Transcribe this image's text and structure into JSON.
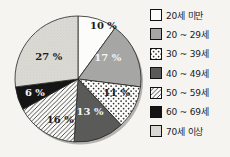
{
  "chart_data": {
    "type": "pie",
    "title": "",
    "unit": "%",
    "start_angle_deg": 0,
    "direction": "clockwise",
    "legend_position": "right",
    "slices": [
      {
        "label": "20세 미만",
        "value": 10,
        "display": "10 %",
        "fill": "white",
        "text_color": "#1c1c1c",
        "la": 26,
        "lr": 0.92
      },
      {
        "label": "20 ~ 29세",
        "value": 17,
        "display": "17 %",
        "fill": "gray",
        "text_color": "#f4f4f4",
        "la": 56,
        "lr": 0.57
      },
      {
        "label": "30 ~ 39세",
        "value": 11,
        "display": "11 %",
        "fill": "dots",
        "text_color": "#1c1c1c",
        "la": 111,
        "lr": 0.66
      },
      {
        "label": "40 ~ 49세",
        "value": 13,
        "display": "13 %",
        "fill": "darkgray",
        "text_color": "#f4f4f4",
        "la": 160,
        "lr": 0.56
      },
      {
        "label": "50 ~ 59세",
        "value": 16,
        "display": "16 %",
        "fill": "hatch",
        "text_color": "#1c1c1c",
        "la": 203,
        "lr": 0.72
      },
      {
        "label": "60 ~ 69세",
        "value": 6,
        "display": "6 %",
        "fill": "black",
        "text_color": "#f4f4f4",
        "la": 252,
        "lr": 0.72
      },
      {
        "label": "70세 이상",
        "value": 27,
        "display": "27 %",
        "fill": "lightgray",
        "text_color": "#1c1c1c",
        "la": 307,
        "lr": 0.58
      }
    ]
  },
  "colors": {
    "white": "#fcfcfb",
    "gray": "#a6a6a4",
    "darkgray": "#5a5a58",
    "black": "#151515",
    "lightgray_base": "#dbdad4",
    "lightgray_dot": "#c9c8c2",
    "dot_ink": "#2e2e2e",
    "hatch_ink": "#3a3a3a",
    "hatch_bg": "#fbfbfa",
    "stroke": "#242424",
    "shadow": "#b4b3ae",
    "background": "#f5f4f1"
  }
}
